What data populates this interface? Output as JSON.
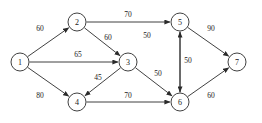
{
  "diagram": {
    "background_color": "#ffffff",
    "stroke_color": "#2b2b2b",
    "text_color": "#1a1a1a",
    "node_radius": 9,
    "nodes": [
      {
        "id": "1",
        "label": "1",
        "x": 20,
        "y": 62
      },
      {
        "id": "2",
        "label": "2",
        "x": 77,
        "y": 22
      },
      {
        "id": "3",
        "label": "3",
        "x": 128,
        "y": 62
      },
      {
        "id": "4",
        "label": "4",
        "x": 77,
        "y": 102
      },
      {
        "id": "5",
        "label": "5",
        "x": 180,
        "y": 22
      },
      {
        "id": "6",
        "label": "6",
        "x": 180,
        "y": 102
      },
      {
        "id": "7",
        "label": "7",
        "x": 237,
        "y": 62
      }
    ],
    "edges": [
      {
        "from": "1",
        "to": "2",
        "weight": "60",
        "label_x": 40,
        "label_y": 28
      },
      {
        "from": "1",
        "to": "3",
        "weight": "65",
        "label_x": 78,
        "label_y": 54
      },
      {
        "from": "1",
        "to": "4",
        "weight": "80",
        "label_x": 40,
        "label_y": 95
      },
      {
        "from": "2",
        "to": "5",
        "weight": "70",
        "label_x": 128,
        "label_y": 14
      },
      {
        "from": "2",
        "to": "3",
        "weight": "60",
        "label_x": 108,
        "label_y": 37
      },
      {
        "from": "3",
        "to": "4",
        "weight": "45",
        "label_x": 98,
        "label_y": 77
      },
      {
        "from": "3",
        "to": "6",
        "weight": "50",
        "label_x": 158,
        "label_y": 73
      },
      {
        "from": "4",
        "to": "6",
        "weight": "70",
        "label_x": 128,
        "label_y": 95
      },
      {
        "from": "6",
        "to": "5",
        "weight": "50",
        "label_x": 147,
        "label_y": 35
      },
      {
        "from": "5",
        "to": "6",
        "weight": "50",
        "label_x": 188,
        "label_y": 60
      },
      {
        "from": "5",
        "to": "7",
        "weight": "90",
        "label_x": 211,
        "label_y": 28
      },
      {
        "from": "6",
        "to": "7",
        "weight": "60",
        "label_x": 211,
        "label_y": 95
      }
    ]
  }
}
